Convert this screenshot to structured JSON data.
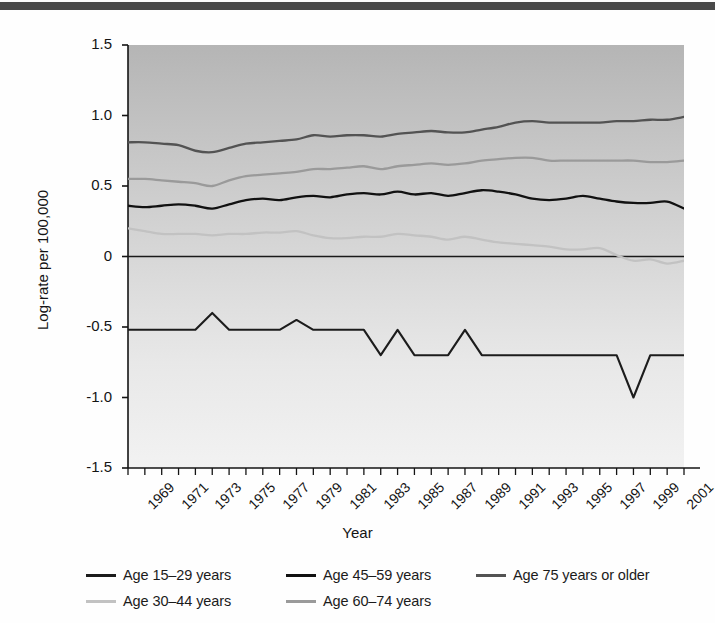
{
  "figure": {
    "background_color": "#fefefe",
    "top_rule_color": "#4a4a4a",
    "plot_bg_top_color": "#b9b9b9",
    "plot_bg_bottom_color": "#eeeeee"
  },
  "legend": {
    "items": [
      {
        "label": "Age 15–29 years",
        "color": "#1c1c1c",
        "column": 1,
        "row": 1
      },
      {
        "label": "Age 30–44 years",
        "color": "#c2c2c2",
        "column": 1,
        "row": 2
      },
      {
        "label": "Age 45–59 years",
        "color": "#111111",
        "column": 2,
        "row": 1
      },
      {
        "label": "Age 60–74 years",
        "color": "#9a9a9a",
        "column": 2,
        "row": 2
      },
      {
        "label": "Age 75 years or older",
        "color": "#535353",
        "column": 3,
        "row": 1
      }
    ]
  },
  "chart_data": {
    "type": "line",
    "title": "",
    "xlabel": "Year",
    "ylabel": "Log-rate per 100,000",
    "xlim": [
      1969,
      2002
    ],
    "ylim": [
      -1.5,
      1.5
    ],
    "grid": false,
    "legend_position": "bottom",
    "yticks": [
      1.5,
      1.0,
      0.5,
      0,
      -0.5,
      -1.0,
      -1.5
    ],
    "ytick_labels": [
      "1.5",
      "1.0",
      "0.5",
      "0",
      "-0.5",
      "-1.0",
      "-1.5"
    ],
    "xtick_labels": [
      "1969",
      "1971",
      "1973",
      "1975",
      "1977",
      "1979",
      "1981",
      "1983",
      "1985",
      "1987",
      "1989",
      "1991",
      "1993",
      "1995",
      "1997",
      "1999",
      "2001"
    ],
    "x": [
      1969,
      1970,
      1971,
      1972,
      1973,
      1974,
      1975,
      1976,
      1977,
      1978,
      1979,
      1980,
      1981,
      1982,
      1983,
      1984,
      1985,
      1986,
      1987,
      1988,
      1989,
      1990,
      1991,
      1992,
      1993,
      1994,
      1995,
      1996,
      1997,
      1998,
      1999,
      2000,
      2001,
      2002
    ],
    "zero_reference_line": 0,
    "series": [
      {
        "name": "Age 75 years or older",
        "color": "#535353",
        "values": [
          0.81,
          0.81,
          0.8,
          0.79,
          0.75,
          0.74,
          0.77,
          0.8,
          0.81,
          0.82,
          0.83,
          0.86,
          0.85,
          0.86,
          0.86,
          0.85,
          0.87,
          0.88,
          0.89,
          0.88,
          0.88,
          0.9,
          0.92,
          0.95,
          0.96,
          0.95,
          0.95,
          0.95,
          0.95,
          0.96,
          0.96,
          0.97,
          0.97,
          0.99
        ]
      },
      {
        "name": "Age 60–74 years",
        "color": "#9a9a9a",
        "values": [
          0.55,
          0.55,
          0.54,
          0.53,
          0.52,
          0.5,
          0.54,
          0.57,
          0.58,
          0.59,
          0.6,
          0.62,
          0.62,
          0.63,
          0.64,
          0.62,
          0.64,
          0.65,
          0.66,
          0.65,
          0.66,
          0.68,
          0.69,
          0.7,
          0.7,
          0.68,
          0.68,
          0.68,
          0.68,
          0.68,
          0.68,
          0.67,
          0.67,
          0.68
        ]
      },
      {
        "name": "Age 45–59 years",
        "color": "#111111",
        "values": [
          0.36,
          0.35,
          0.36,
          0.37,
          0.36,
          0.34,
          0.37,
          0.4,
          0.41,
          0.4,
          0.42,
          0.43,
          0.42,
          0.44,
          0.45,
          0.44,
          0.46,
          0.44,
          0.45,
          0.43,
          0.45,
          0.47,
          0.46,
          0.44,
          0.41,
          0.4,
          0.41,
          0.43,
          0.41,
          0.39,
          0.38,
          0.38,
          0.39,
          0.34
        ]
      },
      {
        "name": "Age 30–44 years",
        "color": "#c2c2c2",
        "values": [
          0.2,
          0.18,
          0.16,
          0.16,
          0.16,
          0.15,
          0.16,
          0.16,
          0.17,
          0.17,
          0.18,
          0.15,
          0.13,
          0.13,
          0.14,
          0.14,
          0.16,
          0.15,
          0.14,
          0.12,
          0.14,
          0.12,
          0.1,
          0.09,
          0.08,
          0.07,
          0.05,
          0.05,
          0.06,
          0.01,
          -0.03,
          -0.02,
          -0.05,
          -0.03
        ]
      },
      {
        "name": "Age 15–29 years",
        "color": "#1c1c1c",
        "values": [
          -0.52,
          -0.52,
          -0.52,
          -0.52,
          -0.52,
          -0.4,
          -0.52,
          -0.52,
          -0.52,
          -0.52,
          -0.45,
          -0.52,
          -0.52,
          -0.52,
          -0.52,
          -0.7,
          -0.52,
          -0.7,
          -0.7,
          -0.7,
          -0.52,
          -0.7,
          -0.7,
          -0.7,
          -0.7,
          -0.7,
          -0.7,
          -0.7,
          -0.7,
          -0.7,
          -1.0,
          -0.7,
          -0.7,
          -0.7
        ]
      }
    ]
  }
}
